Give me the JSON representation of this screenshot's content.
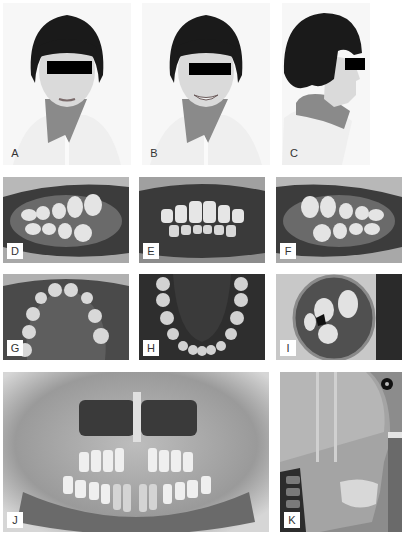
{
  "figure": {
    "panels": [
      {
        "id": "A",
        "label": "A",
        "description": "Frontal facial photograph, lips at rest, eyes masked"
      },
      {
        "id": "B",
        "label": "B",
        "description": "Frontal facial photograph, smiling, eyes masked"
      },
      {
        "id": "C",
        "label": "C",
        "description": "Right lateral profile facial photograph, eye masked"
      },
      {
        "id": "D",
        "label": "D",
        "description": "Intraoral right buccal view in occlusion"
      },
      {
        "id": "E",
        "label": "E",
        "description": "Intraoral frontal view in occlusion"
      },
      {
        "id": "F",
        "label": "F",
        "description": "Intraoral left buccal view in occlusion"
      },
      {
        "id": "G",
        "label": "G",
        "description": "Maxillary occlusal view"
      },
      {
        "id": "H",
        "label": "H",
        "description": "Mandibular occlusal view"
      },
      {
        "id": "I",
        "label": "I",
        "description": "Intraoral view with mirror (overjet)"
      },
      {
        "id": "J",
        "label": "J",
        "description": "Panoramic radiograph, mixed dentition"
      },
      {
        "id": "K",
        "label": "K",
        "description": "Lateral cephalometric radiograph"
      }
    ]
  },
  "colors": {
    "background": "#ffffff",
    "label_bg": "#ffffff",
    "label_text": "#333333",
    "mask": "#000000",
    "hair": "#1a1a1a",
    "skin": "#d9d9d9",
    "collar": "#7a7a7a"
  }
}
